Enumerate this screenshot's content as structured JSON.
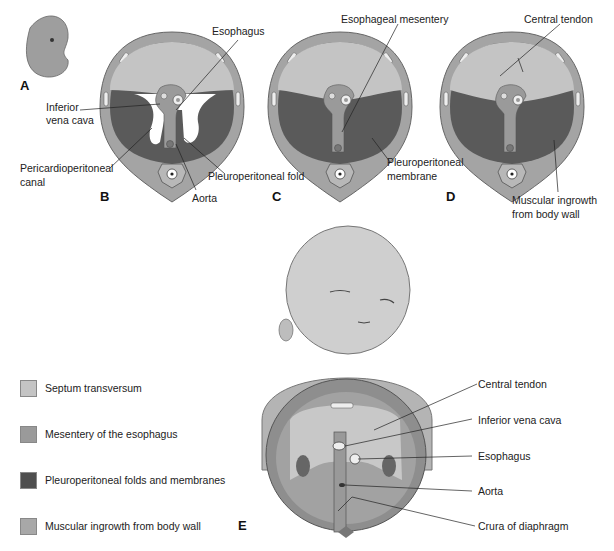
{
  "figure": {
    "panels": {
      "A": {
        "letter": "A"
      },
      "B": {
        "letter": "B",
        "labels": {
          "esophagus": "Esophagus",
          "ivc_1": "Inferior",
          "ivc_2": "vena cava",
          "pcp_1": "Pericardioperitoneal",
          "pcp_2": "canal",
          "fold": "Pleuroperitoneal fold",
          "aorta": "Aorta"
        }
      },
      "C": {
        "letter": "C",
        "labels": {
          "mesentery": "Esophageal mesentery",
          "membrane_1": "Pleuroperitoneal",
          "membrane_2": "membrane"
        }
      },
      "D": {
        "letter": "D",
        "labels": {
          "tendon": "Central tendon",
          "ingrowth_1": "Muscular ingrowth",
          "ingrowth_2": "from body wall"
        }
      },
      "E": {
        "letter": "E",
        "labels": {
          "tendon": "Central tendon",
          "ivc": "Inferior vena cava",
          "esophagus": "Esophagus",
          "aorta": "Aorta",
          "crura": "Crura of diaphragm"
        }
      }
    },
    "legend": [
      {
        "label": "Septum transversum",
        "color": "#c4c4c4"
      },
      {
        "label": "Mesentery of the esophagus",
        "color": "#9a9a9a"
      },
      {
        "label": "Pleuroperitoneal folds and membranes",
        "color": "#4e4e4e"
      },
      {
        "label": "Muscular ingrowth from body wall",
        "color": "#a8a8a8"
      }
    ]
  }
}
